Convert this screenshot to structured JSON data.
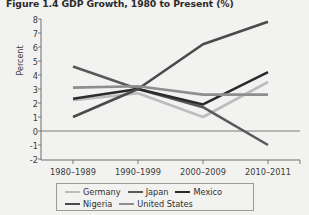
{
  "figure": {
    "title": "Figure 1.4 GDP Growth, 1980 to Present (%)",
    "ylabel": "Percent"
  },
  "axis": {
    "yticks": [
      "8",
      "7",
      "6",
      "5",
      "4",
      "3",
      "2",
      "1",
      "0",
      "-1",
      "-2"
    ],
    "xticks": [
      "1980–1989",
      "1990–1999",
      "2000–2009",
      "2010–2011"
    ]
  },
  "legend": {
    "items": [
      {
        "label": "Germany",
        "color": "#bcbcbc"
      },
      {
        "label": "Japan",
        "color": "#595959"
      },
      {
        "label": "Mexico",
        "color": "#2b2b2b"
      },
      {
        "label": "Nigeria",
        "color": "#4a4a4a"
      },
      {
        "label": "United States",
        "color": "#8e8e8e"
      }
    ]
  },
  "chart_data": {
    "type": "line",
    "title": "Figure 1.4 GDP Growth, 1980 to Present (%)",
    "xlabel": "",
    "ylabel": "Percent",
    "ylim": [
      -2,
      8
    ],
    "grid": false,
    "legend_position": "bottom",
    "categories": [
      "1980–1989",
      "1990–1999",
      "2000–2009",
      "2010–2011"
    ],
    "series": [
      {
        "name": "Germany",
        "color": "#bcbcbc",
        "values": [
          2.2,
          2.7,
          1.0,
          3.5
        ]
      },
      {
        "name": "Japan",
        "color": "#595959",
        "values": [
          4.6,
          3.0,
          1.7,
          -1.0
        ]
      },
      {
        "name": "Mexico",
        "color": "#2b2b2b",
        "values": [
          2.3,
          3.0,
          1.9,
          4.2
        ]
      },
      {
        "name": "Nigeria",
        "color": "#4a4a4a",
        "values": [
          1.0,
          3.0,
          6.2,
          7.8
        ]
      },
      {
        "name": "United States",
        "color": "#8e8e8e",
        "values": [
          3.1,
          3.2,
          2.6,
          2.6
        ]
      }
    ]
  }
}
